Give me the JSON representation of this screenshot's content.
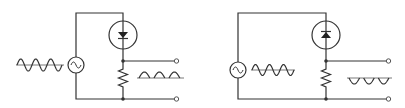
{
  "colors": {
    "line": "#333333",
    "background": "#ffffff"
  },
  "circuits": [
    {
      "id": "positive-rectifier",
      "components": [
        "ac-source",
        "diode",
        "resistor",
        "output-terminals"
      ],
      "diode_direction": "down",
      "input_waveform": "sine",
      "input_cycles": 3,
      "output_waveform": "positive-half-wave",
      "output_pulses": 3
    },
    {
      "id": "negative-rectifier",
      "components": [
        "ac-source",
        "diode",
        "resistor",
        "output-terminals"
      ],
      "diode_direction": "up",
      "input_waveform": "sine",
      "input_cycles": 3,
      "output_waveform": "negative-half-wave",
      "output_pulses": 3
    }
  ]
}
